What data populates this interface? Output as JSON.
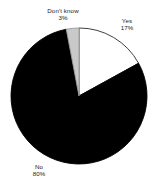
{
  "chart_data": {
    "type": "pie",
    "title": "",
    "subtitle": "",
    "xlabel": "",
    "ylabel": "",
    "grid": false,
    "legend": "none",
    "label_format": "category name above percentage",
    "start_angle_deg": 0,
    "direction": "clockwise",
    "categories": [
      "Yes",
      "No",
      "Don't know"
    ],
    "values": [
      17,
      80,
      3
    ],
    "units": "percent",
    "slices": [
      {
        "name": "Yes",
        "value": 17,
        "value_label": "17%",
        "color": "#ffffff",
        "stroke": "#2b2b2b",
        "start_deg": 0,
        "end_deg": 61.2
      },
      {
        "name": "No",
        "value": 80,
        "value_label": "80%",
        "color": "#000000",
        "stroke": "#000000",
        "start_deg": 61.2,
        "end_deg": 349.2
      },
      {
        "name": "Don't know",
        "value": 3,
        "value_label": "3%",
        "color": "#c9c9c9",
        "stroke": "#9a9a9a",
        "start_deg": 349.2,
        "end_deg": 360
      }
    ],
    "geometry": {
      "center_x": 79,
      "center_y": 96,
      "radius": 68
    }
  },
  "labels": {
    "dontknow": {
      "name": "Don't know",
      "value": "3%"
    },
    "yes": {
      "name": "Yes",
      "value": "17%"
    },
    "no": {
      "name": "No",
      "value": "80%"
    }
  },
  "colors": {
    "background": "#ffffff",
    "text": "#1a1a1a",
    "slice_yes": "#ffffff",
    "slice_no": "#000000",
    "slice_dontknow": "#c9c9c9",
    "outline": "#2b2b2b"
  }
}
